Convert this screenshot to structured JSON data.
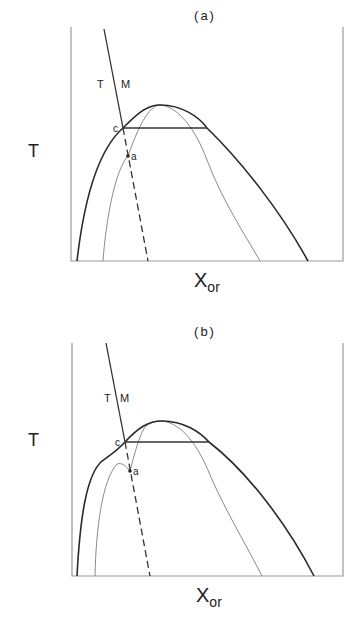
{
  "colors": {
    "frame": "#9a9a9a",
    "bold_curve": "#2a2a2a",
    "thin_curve": "#8a8a8a",
    "tie_line": "#333333",
    "tm_line": "#333333",
    "text": "#222222"
  },
  "panels": [
    {
      "id": "a",
      "title": "(a)",
      "title_pos": [
        205,
        20
      ],
      "y_label": "T",
      "y_label_pos": [
        28,
        157
      ],
      "x_label_main": "X",
      "x_label_sub": "or",
      "x_label_pos": [
        194,
        287
      ],
      "tm_labels": {
        "t": "T",
        "m": "M",
        "t_pos": [
          97,
          88
        ],
        "m_pos": [
          121,
          88
        ]
      },
      "frame": {
        "left": 71,
        "right": 343,
        "top": 27,
        "bottom": 261
      },
      "tm_solid": [
        [
          104,
          29
        ],
        [
          123,
          128
        ]
      ],
      "tm_dashed": [
        [
          123,
          128
        ],
        [
          148,
          261
        ]
      ],
      "tie_line": [
        [
          123,
          128
        ],
        [
          207,
          128
        ]
      ],
      "bold_curve_path": "M 77 261 C 84 200, 98 150, 123 128 C 135 116, 145 106, 158 105 C 182 104, 200 118, 207 128 C 240 160, 280 210, 308 261",
      "thin_curve_path": "M 103 261 C 106 220, 115 170, 128 156 C 138 128, 148 106, 160 105 C 178 106, 196 130, 207 160 C 222 200, 245 235, 260 261",
      "points": [
        {
          "label": "c",
          "pos": [
            123,
            128
          ],
          "label_pos": [
            113,
            132
          ],
          "dot": false
        },
        {
          "label": "a",
          "pos": [
            128,
            156
          ],
          "label_pos": [
            131,
            160
          ],
          "dot": true
        }
      ]
    },
    {
      "id": "b",
      "title": "(b)",
      "title_pos": [
        205,
        336
      ],
      "y_label": "T",
      "y_label_pos": [
        28,
        446
      ],
      "x_label_main": "X",
      "x_label_sub": "or",
      "x_label_pos": [
        196,
        602
      ],
      "tm_labels": {
        "t": "T",
        "m": "M",
        "t_pos": [
          104,
          402
        ],
        "m_pos": [
          120,
          402
        ]
      },
      "frame": {
        "left": 72,
        "right": 343,
        "top": 343,
        "bottom": 576
      },
      "tm_solid": [
        [
          106,
          343
        ],
        [
          125,
          442
        ]
      ],
      "tm_dashed": [
        [
          125,
          442
        ],
        [
          150,
          576
        ]
      ],
      "tie_line": [
        [
          125,
          442
        ],
        [
          209,
          442
        ]
      ],
      "bold_curve_path": "M 77 576 C 80 520, 86 475, 102 461 C 112 454, 118 450, 125 442 C 138 428, 148 421, 162 421 C 184 421, 200 432, 209 442 C 245 470, 285 520, 314 576",
      "thin_curve_path": "M 95 576 C 96 530, 102 480, 117 464 C 122 462, 127 467, 130 471 C 134 456, 140 432, 146 426 C 152 421, 158 421, 163 421 C 182 424, 198 445, 210 475 C 226 512, 248 548, 262 576",
      "points": [
        {
          "label": "c",
          "pos": [
            125,
            442
          ],
          "label_pos": [
            115,
            446
          ],
          "dot": false
        },
        {
          "label": "a",
          "pos": [
            130,
            471
          ],
          "label_pos": [
            133,
            475
          ],
          "dot": true
        }
      ]
    }
  ]
}
